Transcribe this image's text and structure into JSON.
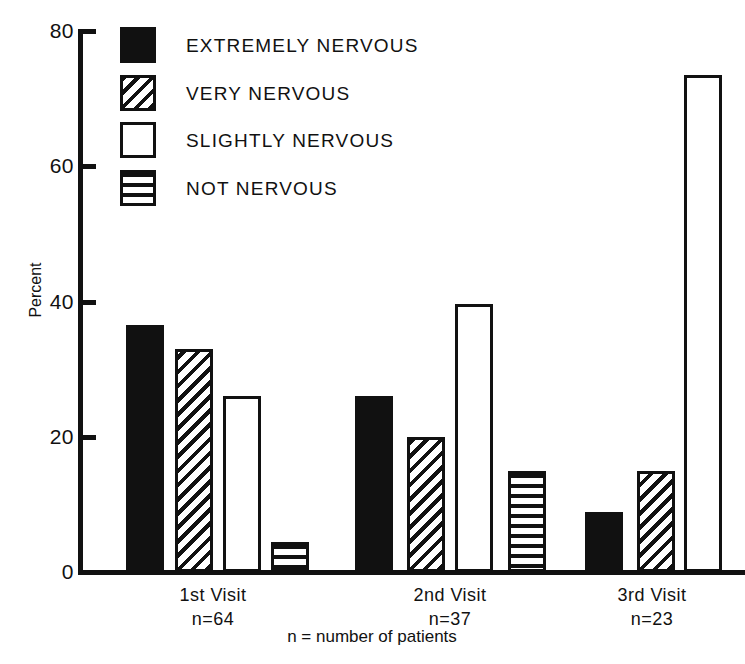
{
  "chart_data": {
    "type": "bar",
    "title": "",
    "xlabel": "",
    "ylabel": "Percent",
    "ylim": [
      0,
      80
    ],
    "yticks": [
      0,
      20,
      40,
      60,
      80
    ],
    "ytick_labels": [
      "0",
      "20",
      "40",
      "60",
      "80"
    ],
    "grid": false,
    "legend_position": "upper-left-inside",
    "categories": [
      "1st Visit",
      "2nd Visit",
      "3rd Visit"
    ],
    "category_sublabels": [
      "n=64",
      "n=37",
      "n=23"
    ],
    "footnote": "n = number of patients",
    "series": [
      {
        "name": "EXTREMELY NERVOUS",
        "fill": "solid",
        "values": [
          36.5,
          26.0,
          8.9
        ]
      },
      {
        "name": "VERY NERVOUS",
        "fill": "diagonal",
        "values": [
          33.0,
          20.0,
          15.0
        ]
      },
      {
        "name": "SLIGHTLY NERVOUS",
        "fill": "open",
        "values": [
          26.0,
          39.6,
          73.5
        ]
      },
      {
        "name": "NOT NERVOUS",
        "fill": "horizontal",
        "values": [
          4.4,
          14.9,
          null
        ]
      }
    ]
  },
  "axis": {
    "y_title": "Percent",
    "ticks": [
      {
        "label": "80",
        "value": 80
      },
      {
        "label": "60",
        "value": 60
      },
      {
        "label": "40",
        "value": 40
      },
      {
        "label": "20",
        "value": 20
      },
      {
        "label": "0",
        "value": 0
      }
    ]
  },
  "legend": {
    "items": [
      {
        "label": "EXTREMELY NERVOUS",
        "fill": "solid"
      },
      {
        "label": "VERY NERVOUS",
        "fill": "diagonal"
      },
      {
        "label": "SLIGHTLY NERVOUS",
        "fill": "open"
      },
      {
        "label": "NOT NERVOUS",
        "fill": "horizontal"
      }
    ]
  },
  "groups": [
    {
      "name": "1st Visit",
      "n": "n=64"
    },
    {
      "name": "2nd Visit",
      "n": "n=37"
    },
    {
      "name": "3rd Visit",
      "n": "n=23"
    }
  ],
  "footnote": "n = number of patients",
  "colors": {
    "ink": "#111111",
    "paper": "#ffffff"
  }
}
